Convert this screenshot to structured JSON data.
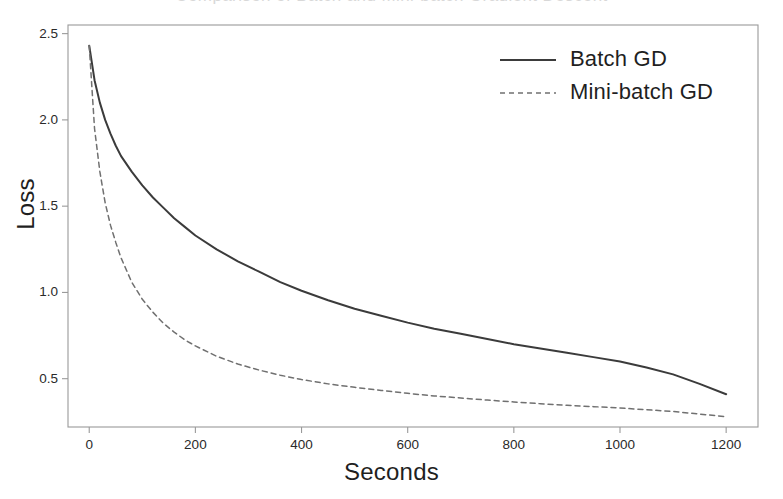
{
  "figure": {
    "cropped_title_remnant": "Comparison of Batch and Mini-batch Gradient Descent"
  },
  "chart_data": {
    "type": "line",
    "title": "",
    "xlabel": "Seconds",
    "ylabel": "Loss",
    "xlim": [
      -40,
      1260
    ],
    "ylim": [
      0.22,
      2.55
    ],
    "grid": false,
    "legend_position": "top-right",
    "xticks": [
      0,
      200,
      400,
      600,
      800,
      1000,
      1200
    ],
    "xticklabels": [
      "0",
      "200",
      "400",
      "600",
      "800",
      "1000",
      "1200"
    ],
    "yticks": [
      0.5,
      1.0,
      1.5,
      2.0,
      2.5
    ],
    "yticklabels": [
      "0.5",
      "1.0",
      "1.5",
      "2.0",
      "2.5"
    ],
    "x": [
      0,
      10,
      20,
      30,
      40,
      50,
      60,
      80,
      100,
      120,
      140,
      160,
      180,
      200,
      240,
      280,
      320,
      360,
      400,
      450,
      500,
      550,
      600,
      650,
      700,
      750,
      800,
      850,
      900,
      950,
      1000,
      1050,
      1100,
      1150,
      1200
    ],
    "series": [
      {
        "name": "Batch GD",
        "style": "solid",
        "color": "#3b3b3b",
        "values": [
          2.43,
          2.23,
          2.1,
          2.0,
          1.92,
          1.85,
          1.79,
          1.7,
          1.62,
          1.55,
          1.49,
          1.43,
          1.38,
          1.33,
          1.25,
          1.18,
          1.12,
          1.06,
          1.01,
          0.955,
          0.905,
          0.865,
          0.825,
          0.79,
          0.76,
          0.73,
          0.7,
          0.675,
          0.65,
          0.625,
          0.6,
          0.565,
          0.525,
          0.47,
          0.41
        ]
      },
      {
        "name": "Mini-batch GD",
        "style": "dashed",
        "color": "#707070",
        "values": [
          2.43,
          1.95,
          1.7,
          1.52,
          1.39,
          1.29,
          1.2,
          1.06,
          0.96,
          0.885,
          0.82,
          0.77,
          0.725,
          0.69,
          0.63,
          0.585,
          0.55,
          0.52,
          0.495,
          0.47,
          0.45,
          0.432,
          0.415,
          0.4,
          0.388,
          0.376,
          0.365,
          0.355,
          0.346,
          0.338,
          0.33,
          0.32,
          0.31,
          0.295,
          0.28
        ]
      }
    ],
    "legend": [
      {
        "label": "Batch GD",
        "style": "solid"
      },
      {
        "label": "Mini-batch GD",
        "style": "dashed"
      }
    ]
  },
  "plot_geometry": {
    "left": 68,
    "right": 758,
    "top": 25,
    "bottom": 427
  }
}
